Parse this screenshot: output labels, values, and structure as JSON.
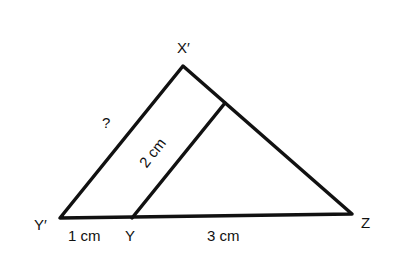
{
  "diagram": {
    "type": "similar-triangles",
    "vertices": {
      "apex": "X′",
      "bottom_left": "Y′",
      "inner_base": "Y",
      "right": "Z"
    },
    "labels": {
      "x_prime": "X′",
      "y_prime": "Y′",
      "y": "Y",
      "z": "Z",
      "unknown_side": "?",
      "inner_side": "2 cm",
      "segment_y_prime_y": "1 cm",
      "segment_y_z": "3 cm"
    },
    "colors": {
      "stroke": "#111111",
      "background": "#ffffff"
    }
  }
}
